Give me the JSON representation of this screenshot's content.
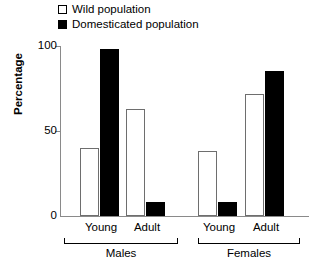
{
  "chart_data": {
    "type": "bar",
    "title": "",
    "xlabel": "",
    "ylabel": "Percentage",
    "ylim": [
      0,
      100
    ],
    "yticks": [
      0,
      50,
      100
    ],
    "ytick_labels": [
      "0",
      "50",
      "100"
    ],
    "grid": false,
    "legend_position": "top-left",
    "categories": [
      "Young",
      "Adult",
      "Young",
      "Adult"
    ],
    "groups": [
      {
        "label": "Males",
        "categories": [
          "Young",
          "Adult"
        ]
      },
      {
        "label": "Females",
        "categories": [
          "Young",
          "Adult"
        ]
      }
    ],
    "series": [
      {
        "name": "Wild population",
        "color": "#ffffff",
        "edgecolor": "#6e6e6e",
        "values": [
          40,
          63,
          38,
          72
        ]
      },
      {
        "name": "Domesticated population",
        "color": "#000000",
        "edgecolor": "#000000",
        "values": [
          98,
          8,
          8,
          85
        ]
      }
    ],
    "bars": [
      {
        "group": "Males",
        "category": "Young",
        "series": "Wild population",
        "value": 40
      },
      {
        "group": "Males",
        "category": "Young",
        "series": "Domesticated population",
        "value": 98
      },
      {
        "group": "Males",
        "category": "Adult",
        "series": "Wild population",
        "value": 63
      },
      {
        "group": "Males",
        "category": "Adult",
        "series": "Domesticated population",
        "value": 8
      },
      {
        "group": "Females",
        "category": "Young",
        "series": "Wild population",
        "value": 38
      },
      {
        "group": "Females",
        "category": "Young",
        "series": "Domesticated population",
        "value": 8
      },
      {
        "group": "Females",
        "category": "Adult",
        "series": "Wild population",
        "value": 72
      },
      {
        "group": "Females",
        "category": "Adult",
        "series": "Domesticated population",
        "value": 85
      }
    ]
  },
  "legend": {
    "items": [
      {
        "label": "Wild population",
        "swatch": "wild-population-swatch"
      },
      {
        "label": "Domesticated population",
        "swatch": "domesticated-population-swatch"
      }
    ]
  },
  "yaxis": {
    "title": "Percentage",
    "ticks": [
      {
        "label": "100",
        "value": 100
      },
      {
        "label": "50",
        "value": 50
      },
      {
        "label": "0",
        "value": 0
      }
    ]
  },
  "xaxis": {
    "category_labels": [
      "Young",
      "Adult",
      "Young",
      "Adult"
    ],
    "group_labels": [
      "Males",
      "Females"
    ]
  }
}
